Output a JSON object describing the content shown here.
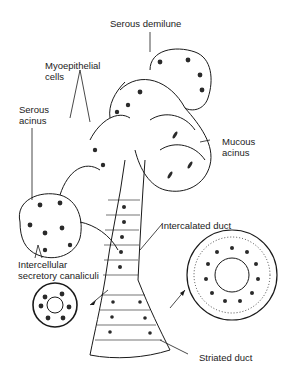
{
  "figure": {
    "labels": {
      "serous_demilune": "Serous demilune",
      "myoepithelial_1": "Myoepithelial",
      "myoepithelial_2": "cells",
      "serous_acinus_1": "Serous",
      "serous_acinus_2": "acinus",
      "mucous_acinus_1": "Mucous",
      "mucous_acinus_2": "acinus",
      "intercalated_duct": "Intercalated duct",
      "canaliculi_1": "Intercellular",
      "canaliculi_2": "secretory canaliculi",
      "striated_duct": "Striated duct"
    },
    "colors": {
      "ink": "#1a1a1a",
      "nucleus": "#2a2a2a",
      "background": "#ffffff"
    }
  }
}
